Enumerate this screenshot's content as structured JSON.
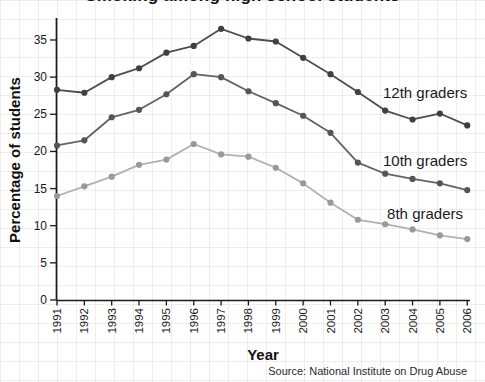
{
  "chart_data": {
    "type": "line",
    "title": "Smoking among high school students",
    "title_note": "title is cropped at top edge of image; only bottoms of letters visible",
    "xlabel": "Year",
    "ylabel": "Percentage of students",
    "source": "Source: National Institute on Drug Abuse",
    "categories": [
      "1991",
      "1992",
      "1993",
      "1994",
      "1995",
      "1996",
      "1997",
      "1998",
      "1999",
      "2000",
      "2001",
      "2002",
      "2003",
      "2004",
      "2005",
      "2006"
    ],
    "yticks": [
      0,
      5,
      10,
      15,
      20,
      25,
      30,
      35
    ],
    "ylim": [
      0,
      37
    ],
    "grid": "faint graph-paper background over whole image",
    "legend_position": "inline-right of each line",
    "series": [
      {
        "name": "12th graders",
        "line_color": "#4d4d4d",
        "marker_color": "#3f3f3f",
        "values": [
          28.3,
          27.9,
          30.0,
          31.2,
          33.3,
          34.2,
          36.5,
          35.2,
          34.8,
          32.6,
          30.4,
          28.0,
          25.5,
          24.3,
          25.1,
          23.5
        ]
      },
      {
        "name": "10th graders",
        "line_color": "#636363",
        "marker_color": "#555555",
        "values": [
          20.8,
          21.5,
          24.6,
          25.6,
          27.7,
          30.4,
          30.0,
          28.1,
          26.5,
          24.8,
          22.5,
          18.5,
          17.0,
          16.3,
          15.7,
          14.8
        ]
      },
      {
        "name": "8th graders",
        "line_color": "#b1b1b1",
        "marker_color": "#999999",
        "values": [
          14.0,
          15.3,
          16.6,
          18.2,
          18.9,
          21.0,
          19.6,
          19.3,
          17.8,
          15.7,
          13.1,
          10.8,
          10.2,
          9.5,
          8.7,
          8.2
        ]
      }
    ],
    "axis_color": "#1a1a1a"
  }
}
